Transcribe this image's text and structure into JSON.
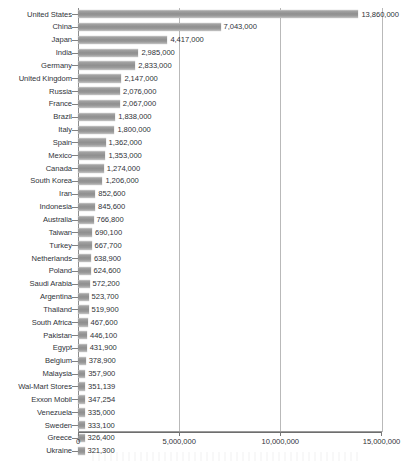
{
  "chart_data": {
    "type": "bar",
    "orientation": "horizontal",
    "title": "",
    "subtitle": "",
    "xlabel": "",
    "ylabel": "",
    "xlim": [
      0,
      15000000
    ],
    "grid": true,
    "legend": null,
    "xticks": [
      "0",
      "5,000,000",
      "10,000,000",
      "15,000,000"
    ],
    "xtick_values": [
      0,
      5000000,
      10000000,
      15000000
    ],
    "categories": [
      "United States",
      "China",
      "Japan",
      "India",
      "Germany",
      "United Kingdom",
      "Russia",
      "France",
      "Brazil",
      "Italy",
      "Spain",
      "Mexico",
      "Canada",
      "South Korea",
      "Iran",
      "Indonesia",
      "Australia",
      "Taiwan",
      "Turkey",
      "Netherlands",
      "Poland",
      "Saudi Arabia",
      "Argentina",
      "Thailand",
      "South Africa",
      "Pakistan",
      "Egypt",
      "Belgium",
      "Malaysia",
      "Wal-Mart Stores",
      "Exxon Mobil",
      "Venezuela",
      "Sweden",
      "Greece",
      "Ukraine"
    ],
    "values": [
      13860000,
      7043000,
      4417000,
      2985000,
      2833000,
      2147000,
      2076000,
      2067000,
      1838000,
      1800000,
      1362000,
      1353000,
      1274000,
      1206000,
      852600,
      845600,
      766800,
      690100,
      667700,
      638900,
      624600,
      572200,
      523700,
      519900,
      467600,
      446100,
      431900,
      378900,
      357900,
      351139,
      347254,
      335000,
      333100,
      326400,
      321300
    ],
    "value_labels": [
      "13,860,000",
      "7,043,000",
      "4,417,000",
      "2,985,000",
      "2,833,000",
      "2,147,000",
      "2,076,000",
      "2,067,000",
      "1,838,000",
      "1,800,000",
      "1,362,000",
      "1,353,000",
      "1,274,000",
      "1,206,000",
      "852,600",
      "845,600",
      "766,800",
      "690,100",
      "667,700",
      "638,900",
      "624,600",
      "572,200",
      "523,700",
      "519,900",
      "467,600",
      "446,100",
      "431,900",
      "378,900",
      "357,900",
      "351,139",
      "347,254",
      "335,000",
      "333,100",
      "326,400",
      "321,300"
    ],
    "colors": {
      "bar": "#999999",
      "bar_highlight": "#c9c9c9",
      "gridline": "#b9b9b9",
      "axis": "#6e6e6e",
      "text": "#30343a",
      "background": "#ffffff"
    }
  }
}
